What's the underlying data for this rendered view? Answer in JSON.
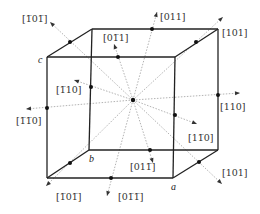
{
  "figure": {
    "center": {
      "x": 133,
      "y": 100
    },
    "vertices": {
      "front_tl": {
        "x": 47,
        "y": 57
      },
      "front_tr": {
        "x": 175,
        "y": 57
      },
      "front_bl": {
        "x": 47,
        "y": 178
      },
      "front_br": {
        "x": 173,
        "y": 178
      },
      "back_tl": {
        "x": 92,
        "y": 29
      },
      "back_tr": {
        "x": 218,
        "y": 29
      },
      "back_bl": {
        "x": 89,
        "y": 150
      },
      "back_br": {
        "x": 218,
        "y": 150
      }
    },
    "vertex_labels": [
      {
        "id": "c",
        "text": "c",
        "x": 38,
        "y": 63
      },
      {
        "id": "b",
        "text": "b",
        "x": 89,
        "y": 162
      },
      {
        "id": "a",
        "text": "a",
        "x": 171,
        "y": 190
      }
    ],
    "directions": [
      {
        "id": "d-1bar01bar-top",
        "label": "[1̅0 1̅]",
        "lx": 22,
        "ly": 22,
        "dot": [
          70,
          42
        ],
        "tip": [
          50,
          22
        ]
      },
      {
        "id": "d-01bar1",
        "label": "[0 1̅ 1]",
        "lx": 103,
        "ly": 41,
        "dot": [
          118,
          57
        ],
        "tip": [
          114,
          44
        ]
      },
      {
        "id": "d-011",
        "label": "[011]",
        "lx": 160,
        "ly": 20,
        "dot": [
          152,
          29
        ],
        "tip": [
          157,
          12
        ]
      },
      {
        "id": "d-101-top",
        "label": "[101]",
        "lx": 222,
        "ly": 36,
        "dot": [
          196,
          42
        ],
        "tip": [
          223,
          17
        ]
      },
      {
        "id": "d-1bar10",
        "label": "[1̅ 10]",
        "lx": 56,
        "ly": 93,
        "dot": [
          91,
          87
        ],
        "tip": [
          74,
          80
        ]
      },
      {
        "id": "d-1bar1bar0",
        "label": "[1̅ 1̅ 0]",
        "lx": 16,
        "ly": 124,
        "dot": [
          47,
          108
        ],
        "tip": [
          26,
          109
        ]
      },
      {
        "id": "d-110",
        "label": "[110]",
        "lx": 220,
        "ly": 110,
        "dot": [
          218,
          95
        ],
        "tip": [
          240,
          93
        ]
      },
      {
        "id": "d-11bar0",
        "label": "[1 1̅ 0]",
        "lx": 188,
        "ly": 141,
        "dot": [
          175,
          115
        ],
        "tip": [
          197,
          124
        ]
      },
      {
        "id": "d-01bar1bar-upper",
        "label": "[0 1 1̅]",
        "lx": 130,
        "ly": 170,
        "dot": [
          150,
          150
        ],
        "tip": [
          153,
          163
        ]
      },
      {
        "id": "d-1bar01bar-bottom",
        "label": "[1̅ 0 1̅]",
        "lx": 56,
        "ly": 200,
        "dot": [
          70,
          163
        ],
        "tip": [
          46,
          186
        ]
      },
      {
        "id": "d-01bar1bar-lower",
        "label": "[0 1̅ 1̅]",
        "lx": 118,
        "ly": 200,
        "dot": [
          111,
          178
        ],
        "tip": [
          107,
          196
        ]
      },
      {
        "id": "d-101-bottom",
        "label": "[101]",
        "lx": 222,
        "ly": 176,
        "dot": [
          199,
          162
        ],
        "tip": [
          222,
          184
        ]
      }
    ]
  }
}
